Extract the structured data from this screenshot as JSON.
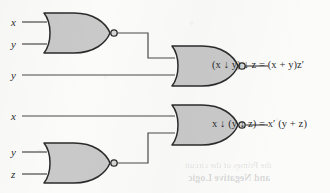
{
  "figure": {
    "kind": "logic-circuit-diagram",
    "background_color": "#fbfbfa",
    "gate_fill_color": "#c9c9c9",
    "gate_stroke_color": "#2b2b2b",
    "wire_color": "#4a4a4a",
    "text_color": "#2b2b2b"
  },
  "circuits": [
    {
      "id": "upper",
      "inputs": [
        {
          "id": "upper-in-x",
          "label": "x"
        },
        {
          "id": "upper-in-y1",
          "label": "y"
        },
        {
          "id": "upper-in-y2",
          "label": "y"
        }
      ],
      "gates": [
        {
          "id": "upper-gate-1",
          "type": "nor-gate",
          "inputs": [
            "x",
            "y"
          ]
        },
        {
          "id": "upper-gate-2",
          "type": "nor-gate",
          "inputs": [
            "upper-gate-1",
            "y"
          ]
        }
      ],
      "output": {
        "id": "upper-output",
        "expression": "(x ↓ y) ↓ z = (x + y)z′",
        "lhs": "(x ↓ y) ↓ z",
        "equals": "=",
        "rhs": "(x + y)z′"
      }
    },
    {
      "id": "lower",
      "inputs": [
        {
          "id": "lower-in-x",
          "label": "x"
        },
        {
          "id": "lower-in-y",
          "label": "y"
        },
        {
          "id": "lower-in-z",
          "label": "z"
        }
      ],
      "gates": [
        {
          "id": "lower-gate-1",
          "type": "nor-gate",
          "inputs": [
            "y",
            "z"
          ]
        },
        {
          "id": "lower-gate-2",
          "type": "nor-gate",
          "inputs": [
            "x",
            "lower-gate-1"
          ]
        }
      ],
      "output": {
        "id": "lower-output",
        "expression": "x ↓ (y ↓ z) = x′ (y + z)",
        "lhs": "x ↓ (y ↓ z)",
        "equals": "=",
        "rhs": "x′ (y + z)"
      }
    }
  ],
  "show_through_text": {
    "line_1": "the Primes of  the circuit",
    "line_2": "and Negative Logic"
  }
}
